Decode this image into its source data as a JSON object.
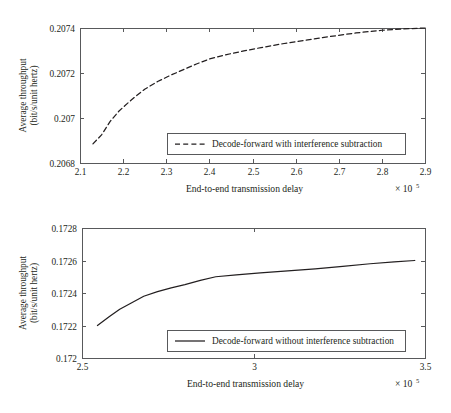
{
  "figure": {
    "title": "",
    "background": "#ffffff",
    "axis_color": "#58595b",
    "curve_color": "#231f20"
  },
  "chart_data": [
    {
      "id": "top",
      "type": "line",
      "title": "",
      "xlabel": "End-to-end transmission delay",
      "ylabel": "Average throughput\n(bit/s/unit hertz)",
      "ylabel_line1": "Average throughput",
      "ylabel_line2": "(bit/s/unit hertz)",
      "x_multiplier_base": "× 10",
      "x_multiplier_exp": "5",
      "x_scale": 100000,
      "xlim": [
        2.1,
        2.9
      ],
      "ylim": [
        0.2068,
        0.2074
      ],
      "grid": false,
      "xticks": [
        2.1,
        2.2,
        2.3,
        2.4,
        2.5,
        2.6,
        2.7,
        2.8,
        2.9
      ],
      "xtick_labels": [
        "2.1",
        "2.2",
        "2.3",
        "2.4",
        "2.5",
        "2.6",
        "2.7",
        "2.8",
        "2.9"
      ],
      "yticks": [
        0.2068,
        0.207,
        0.2072,
        0.2074
      ],
      "ytick_labels": [
        "0.2068",
        "0.207",
        "0.2072",
        "0.2074"
      ],
      "legend_position": "lower-center",
      "series": [
        {
          "name": "Decode-forward with interference subtraction",
          "style": "dashed",
          "color": "#231f20",
          "x": [
            2.13,
            2.15,
            2.17,
            2.19,
            2.21,
            2.23,
            2.25,
            2.28,
            2.31,
            2.34,
            2.37,
            2.4,
            2.44,
            2.48,
            2.52,
            2.57,
            2.62,
            2.68,
            2.74,
            2.8,
            2.85,
            2.9
          ],
          "y": [
            0.206885,
            0.206925,
            0.206985,
            0.20703,
            0.207065,
            0.207098,
            0.207128,
            0.207162,
            0.20719,
            0.207215,
            0.20724,
            0.207262,
            0.207282,
            0.207298,
            0.207313,
            0.20733,
            0.207345,
            0.207362,
            0.207378,
            0.20739,
            0.207396,
            0.2074
          ]
        }
      ]
    },
    {
      "id": "bottom",
      "type": "line",
      "title": "",
      "xlabel": "End-to-end transmission delay",
      "ylabel": "Average throughput\n(bit/s/unit hertz)",
      "ylabel_line1": "Average throughput",
      "ylabel_line2": "(bit/s/unit hertz)",
      "x_multiplier_base": "× 10",
      "x_multiplier_exp": "5",
      "x_scale": 100000,
      "xlim": [
        2.5,
        3.5
      ],
      "ylim": [
        0.172,
        0.1728
      ],
      "grid": false,
      "xticks": [
        2.5,
        3.0,
        3.5
      ],
      "xtick_labels": [
        "2.5",
        "3",
        "3.5"
      ],
      "yticks": [
        0.172,
        0.1722,
        0.1724,
        0.1726,
        0.1728
      ],
      "ytick_labels": [
        "0.172",
        "0.1722",
        "0.1724",
        "0.1726",
        "0.1728"
      ],
      "legend_position": "lower-center",
      "series": [
        {
          "name": "Decode-forward without interference subtraction",
          "style": "solid",
          "color": "#231f20",
          "x": [
            2.545,
            2.58,
            2.61,
            2.645,
            2.68,
            2.72,
            2.76,
            2.8,
            2.845,
            2.89,
            2.95,
            3.02,
            3.1,
            3.18,
            3.26,
            3.34,
            3.41,
            3.47
          ],
          "y": [
            0.1722,
            0.172255,
            0.1723,
            0.17234,
            0.17238,
            0.172408,
            0.172432,
            0.172452,
            0.172478,
            0.1725,
            0.172512,
            0.172524,
            0.172536,
            0.172549,
            0.172564,
            0.17258,
            0.172592,
            0.1726
          ]
        }
      ]
    }
  ]
}
